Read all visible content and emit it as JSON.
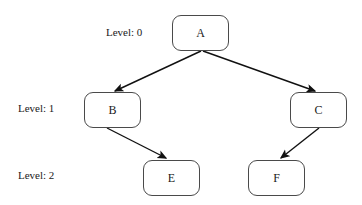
{
  "diagram": {
    "background_color": "#ffffff",
    "node_border_color": "#4a4a4a",
    "node_fill_color": "#ffffff",
    "edge_color": "#111111",
    "text_color": "#1a1a1a",
    "nodes": [
      {
        "id": "A",
        "label": "A",
        "level": 0,
        "x": 172,
        "y": 15,
        "w": 57,
        "h": 36
      },
      {
        "id": "B",
        "label": "B",
        "level": 1,
        "x": 84,
        "y": 92,
        "w": 57,
        "h": 36
      },
      {
        "id": "C",
        "label": "C",
        "level": 1,
        "x": 290,
        "y": 92,
        "w": 57,
        "h": 36
      },
      {
        "id": "E",
        "label": "E",
        "level": 2,
        "x": 143,
        "y": 160,
        "w": 57,
        "h": 36
      },
      {
        "id": "F",
        "label": "F",
        "level": 2,
        "x": 248,
        "y": 160,
        "w": 57,
        "h": 36
      }
    ],
    "edges": [
      {
        "from": "A",
        "to": "B",
        "arrowhead": "filled-triangle"
      },
      {
        "from": "A",
        "to": "C",
        "arrowhead": "filled-triangle"
      },
      {
        "from": "B",
        "to": "E",
        "arrowhead": "filled-triangle"
      },
      {
        "from": "C",
        "to": "F",
        "arrowhead": "filled-triangle"
      }
    ],
    "level_labels": [
      {
        "text": "Level: 0",
        "x": 106,
        "y": 27
      },
      {
        "text": "Level: 1",
        "x": 18,
        "y": 103
      },
      {
        "text": "Level: 2",
        "x": 18,
        "y": 170
      }
    ]
  }
}
